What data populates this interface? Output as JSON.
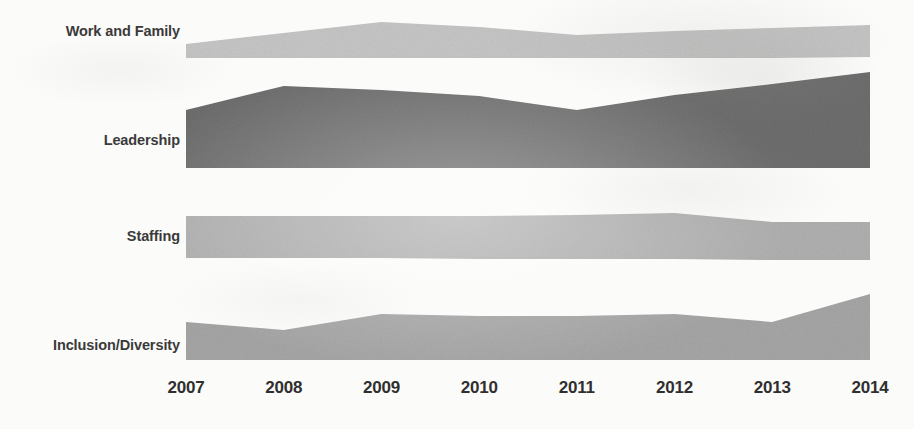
{
  "chart_data": {
    "type": "area",
    "title": "",
    "subtitle": "",
    "xlabel": "",
    "ylabel": "",
    "grid": false,
    "legend_position": "left-labels",
    "orientation": "stacked-stream-bands",
    "categories": [
      "2007",
      "2008",
      "2009",
      "2010",
      "2011",
      "2012",
      "2013",
      "2014"
    ],
    "x": [
      2007,
      2008,
      2009,
      2010,
      2011,
      2012,
      2013,
      2014
    ],
    "xlim": [
      2007,
      2014
    ],
    "ylim": [
      0,
      100
    ],
    "series": [
      {
        "name": "Work and Family",
        "color": "#c6c6c6",
        "values": [
          14,
          22,
          36,
          30,
          23,
          27,
          30,
          33
        ]
      },
      {
        "name": "Leadership",
        "color": "#6e6e6e",
        "values": [
          58,
          82,
          78,
          72,
          58,
          72,
          82,
          96
        ]
      },
      {
        "name": "Staffing",
        "color": "#b0b0b0",
        "values": [
          42,
          42,
          42,
          43,
          44,
          46,
          38,
          38
        ]
      },
      {
        "name": "Inclusion/Diversity",
        "color": "#a6a6a6",
        "values": [
          38,
          30,
          46,
          44,
          44,
          46,
          38,
          66
        ]
      }
    ]
  },
  "axis": {
    "years": [
      "2007",
      "2008",
      "2009",
      "2010",
      "2011",
      "2012",
      "2013",
      "2014"
    ]
  },
  "labels": {
    "items": [
      {
        "text": "Work and Family"
      },
      {
        "text": "Leadership"
      },
      {
        "text": "Staffing"
      },
      {
        "text": "Inclusion/Diversity"
      }
    ]
  },
  "colors": {
    "background": "#fbfbf9",
    "label_text": "#3a3a3a",
    "axis_text": "#2f2f2f",
    "band_work_family": "#c6c6c6",
    "band_leadership": "#6e6e6e",
    "band_staffing": "#b0b0b0",
    "band_inclusion": "#a6a6a6"
  },
  "geometry": {
    "plot_left": 186,
    "plot_right": 870,
    "bands": [
      {
        "name": "Work and Family",
        "color": "#c6c6c6",
        "top": [
          44,
          33,
          22,
          27,
          35,
          31,
          28,
          25
        ],
        "bottom": [
          58,
          58,
          58,
          58,
          58,
          58,
          58,
          57
        ]
      },
      {
        "name": "Leadership",
        "color": "#6e6e6e",
        "top": [
          110,
          86,
          90,
          96,
          110,
          95,
          84,
          72
        ],
        "bottom": [
          168,
          168,
          168,
          168,
          168,
          168,
          168,
          168
        ]
      },
      {
        "name": "Staffing",
        "color": "#b0b0b0",
        "top": [
          216,
          216,
          216,
          216,
          215,
          213,
          222,
          222
        ],
        "bottom": [
          258,
          258,
          258,
          259,
          259,
          259,
          260,
          260
        ]
      },
      {
        "name": "Inclusion/Diversity",
        "color": "#a6a6a6",
        "top": [
          322,
          330,
          314,
          316,
          316,
          314,
          322,
          294
        ]
      }
    ],
    "inclusion_bottom": 360
  }
}
